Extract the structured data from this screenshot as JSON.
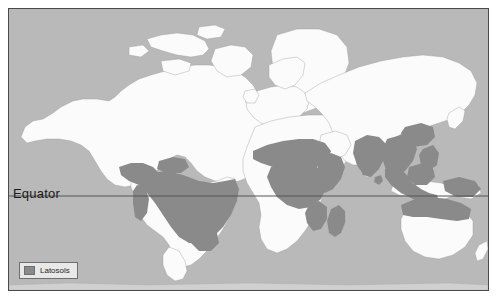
{
  "map": {
    "title": "Latosols",
    "projection": "world",
    "equator_label": "Equator",
    "colors": {
      "ocean": "#b9b9b9",
      "land": "#fbfbfb",
      "latosols": "#8a8a8a",
      "coastline": "#9a9a9a",
      "frame_border": "#4a4a4a",
      "equator_line": "#555555",
      "legend_background": "#e8e8e8",
      "legend_border": "#6e6e6e",
      "label_text": "#1a1a1a"
    },
    "equator_y_fraction": 0.665
  },
  "legend": {
    "items": [
      {
        "label": "Latosols",
        "swatch_color": "#8a8a8a"
      }
    ]
  },
  "regions": {
    "land_names": [
      "North America",
      "Greenland",
      "South America",
      "Europe",
      "Africa",
      "Asia",
      "Australia",
      "New Zealand",
      "Iceland",
      "Madagascar",
      "Indonesia",
      "Japan",
      "Philippines",
      "British Isles",
      "Sri Lanka",
      "Papua New Guinea"
    ],
    "latosol_names": [
      "Central America",
      "Caribbean",
      "Amazon Basin",
      "Brazilian Highlands",
      "West Africa",
      "Congo Basin",
      "East Africa",
      "Madagascar",
      "India",
      "Indochina",
      "Indonesia",
      "Philippines",
      "New Guinea",
      "Northern Australia"
    ]
  }
}
